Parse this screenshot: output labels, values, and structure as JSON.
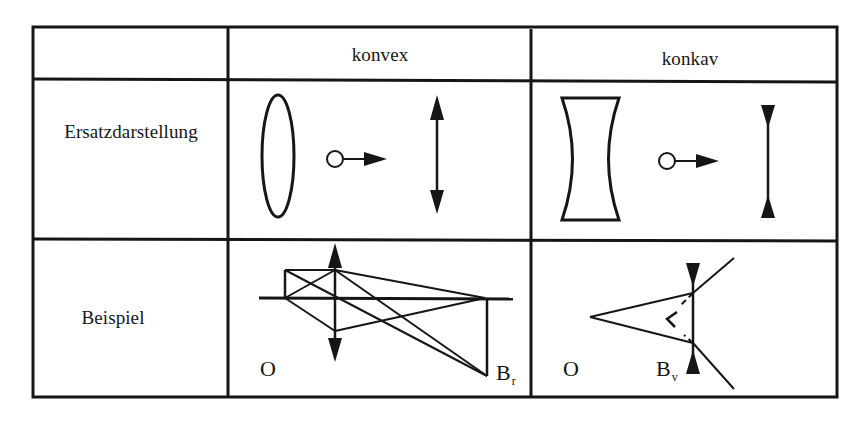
{
  "table": {
    "columns": [
      "",
      "konvex",
      "konkav"
    ],
    "rows": [
      {
        "label": "Ersatzdarstellung",
        "konvex": {
          "physical_shape": "biconvex-lens-ellipse-icon",
          "arrow": "maps-to-arrow-icon",
          "symbol": "double-arrow-outward-lens-symbol-icon"
        },
        "konkav": {
          "physical_shape": "biconcave-lens-icon",
          "arrow": "maps-to-arrow-icon",
          "symbol": "double-arrow-inward-lens-symbol-icon"
        }
      },
      {
        "label": "Beispiel",
        "konvex": {
          "object_label": "O",
          "image_label": "B",
          "image_subscript": "r",
          "description": "real image formation by converging lens"
        },
        "konkav": {
          "object_label": "O",
          "image_label": "B",
          "image_subscript": "v",
          "description": "virtual image formation by diverging lens"
        }
      }
    ]
  },
  "colors": {
    "ink": "#161616",
    "background": "#ffffff"
  }
}
